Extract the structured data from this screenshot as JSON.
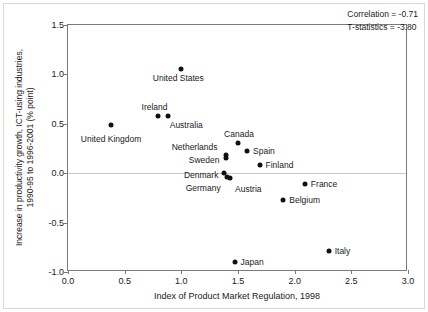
{
  "chart_data": {
    "type": "scatter",
    "title": "",
    "xlabel": "Index of Product Market Regulation, 1998",
    "ylabel": "Increase in productivity growth, ICT-using industries, 1990-95 to 1996-2001 (% point)",
    "ylabel_line1": "Increase in productivity growth, ICT-using industries,",
    "ylabel_line2": "1990-95 to 1996-2001 (% point)",
    "xlim": [
      0.0,
      3.0
    ],
    "ylim": [
      -1.0,
      1.5
    ],
    "xticks": [
      "0.0",
      "0.5",
      "1.0",
      "1.5",
      "2.0",
      "2.5",
      "3.0"
    ],
    "xtick_values": [
      0.0,
      0.5,
      1.0,
      1.5,
      2.0,
      2.5,
      3.0
    ],
    "yticks": [
      "1.5",
      "1.0",
      "0.5",
      "0.0",
      "-0.5",
      "-1.0"
    ],
    "ytick_values": [
      1.5,
      1.0,
      0.5,
      0.0,
      -0.5,
      -1.0
    ],
    "grid": false,
    "zero_line": true,
    "marker_color": "#111111",
    "legend": "none",
    "points": [
      {
        "label": "United States",
        "x": 1.0,
        "y": 1.05,
        "label_dx": -3,
        "label_dy": 9,
        "label_align": "center"
      },
      {
        "label": "Ireland",
        "x": 0.79,
        "y": 0.58,
        "label_dx": -3,
        "label_dy": -9,
        "label_align": "center"
      },
      {
        "label": "Australia",
        "x": 0.88,
        "y": 0.58,
        "label_dx": 2,
        "label_dy": 9,
        "label_align": "left"
      },
      {
        "label": "United Kingdom",
        "x": 0.38,
        "y": 0.49,
        "label_dx": 0,
        "label_dy": 14,
        "label_align": "center"
      },
      {
        "label": "Canada",
        "x": 1.5,
        "y": 0.31,
        "label_dx": 1,
        "label_dy": -9,
        "label_align": "center"
      },
      {
        "label": "Spain",
        "x": 1.58,
        "y": 0.22,
        "label_dx": 6,
        "label_dy": 0,
        "label_align": "left"
      },
      {
        "label": "Netherlands",
        "x": 1.39,
        "y": 0.18,
        "label_dx": -8,
        "label_dy": -8,
        "label_align": "right"
      },
      {
        "label": "Sweden",
        "x": 1.39,
        "y": 0.15,
        "label_dx": -6,
        "label_dy": 2,
        "label_align": "right"
      },
      {
        "label": "Finland",
        "x": 1.69,
        "y": 0.08,
        "label_dx": 6,
        "label_dy": 0,
        "label_align": "left"
      },
      {
        "label": "Denmark",
        "x": 1.38,
        "y": 0.0,
        "label_dx": -6,
        "label_dy": 2,
        "label_align": "right"
      },
      {
        "label": "Germany",
        "x": 1.4,
        "y": -0.04,
        "label_dx": -6,
        "label_dy": 11,
        "label_align": "right"
      },
      {
        "label": "Austria",
        "x": 1.43,
        "y": -0.05,
        "label_dx": 5,
        "label_dy": 11,
        "label_align": "left"
      },
      {
        "label": "France",
        "x": 2.09,
        "y": -0.11,
        "label_dx": 6,
        "label_dy": 0,
        "label_align": "left"
      },
      {
        "label": "Belgium",
        "x": 1.9,
        "y": -0.27,
        "label_dx": 6,
        "label_dy": 0,
        "label_align": "left"
      },
      {
        "label": "Italy",
        "x": 2.3,
        "y": -0.79,
        "label_dx": 6,
        "label_dy": 0,
        "label_align": "left"
      },
      {
        "label": "Japan",
        "x": 1.47,
        "y": -0.9,
        "label_dx": 6,
        "label_dy": 0,
        "label_align": "left"
      }
    ],
    "annotations": [
      "Correlation = -0.71",
      "T-statistics = -3.80"
    ]
  },
  "stats": {
    "correlation": "Correlation = -0.71",
    "tstatistics": "T-statistics = -3.80"
  }
}
